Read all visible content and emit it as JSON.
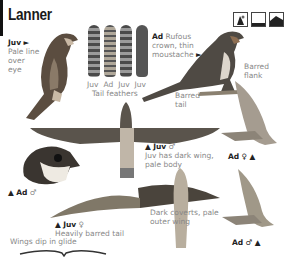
{
  "page": {
    "title": "Lanner",
    "habitat_icons": [
      "desert-rock-icon",
      "open-country-icon",
      "mountain-icon"
    ]
  },
  "labels": {
    "juv_perched": {
      "age": "Juv",
      "arrow": "►",
      "text": "Pale line over eye"
    },
    "tail_feathers": {
      "items": [
        "Juv",
        "Ad",
        "Juv",
        "Juv"
      ],
      "caption": "Tail feathers"
    },
    "ad_perched": {
      "age": "Ad",
      "text": "Rufous crown, thin moustache",
      "arrow": "►"
    },
    "barred_flank": "Barred flank",
    "barred_tail": "Barred tail",
    "juv_male_flight": {
      "marker": "▲",
      "age": "Juv",
      "sex": "♂",
      "text": "Juv has dark wing, pale body"
    },
    "ad_female_side": {
      "age": "Ad",
      "sex": "♀",
      "marker": "▲"
    },
    "ad_male_head": {
      "marker": "▲",
      "age": "Ad",
      "sex": "♂"
    },
    "juv_female_flight": {
      "marker": "▲",
      "age": "Juv",
      "sex": "♀",
      "text": "Heavily barred tail"
    },
    "dark_coverts": "Dark coverts, pale outer wing",
    "wings_dip": "Wings dip in glide",
    "ad_male_side": {
      "age": "Ad",
      "sex": "♂",
      "marker": "▲"
    }
  },
  "colors": {
    "text_dark": "#222222",
    "text_grey": "#888888",
    "background": "#ffffff"
  }
}
